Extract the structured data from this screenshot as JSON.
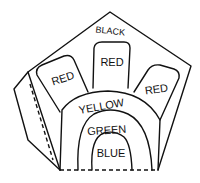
{
  "diagram": {
    "regions": {
      "outer": {
        "label": "BLACK"
      },
      "tabs": [
        {
          "label": "RED"
        },
        {
          "label": "RED"
        },
        {
          "label": "RED"
        }
      ],
      "arch_outer": {
        "label": "YELLOW"
      },
      "arch_middle": {
        "label": "GREEN"
      },
      "arch_inner": {
        "label": "BLUE"
      }
    },
    "lines": {
      "fold_lines": "dashed"
    }
  }
}
